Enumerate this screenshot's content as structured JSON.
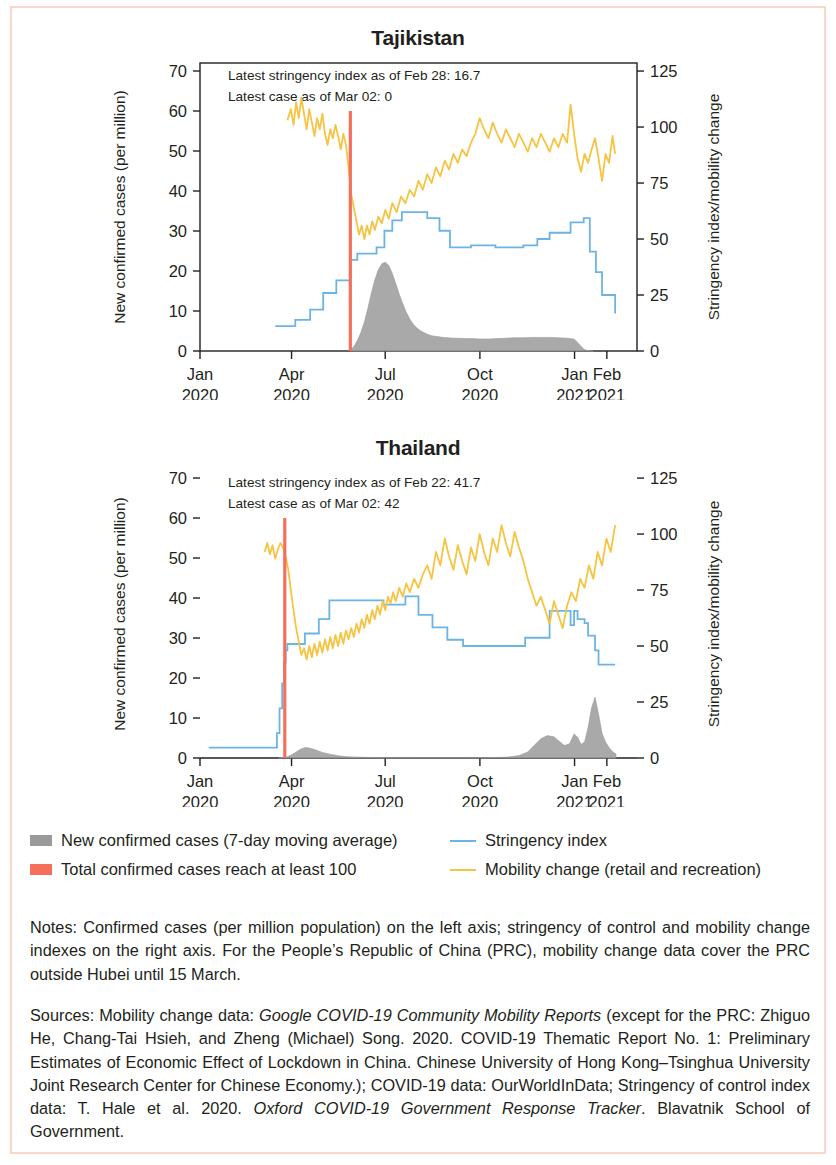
{
  "frame": {
    "border_color": "#f7d8cb"
  },
  "colors": {
    "cases_area": "#9a9a9a",
    "threshold_line": "#f4705a",
    "stringency_line": "#6cb4e4",
    "mobility_line": "#f5c443",
    "axis": "#231f20"
  },
  "legend": {
    "items": [
      {
        "label": "New confirmed cases (7-day moving average)",
        "marker": "area-swatch",
        "color": "#9a9a9a"
      },
      {
        "label": "Stringency index",
        "marker": "line-swatch",
        "color": "#6cb4e4"
      },
      {
        "label": "Total confirmed cases reach at least 100",
        "marker": "area-swatch",
        "color": "#f4705a"
      },
      {
        "label": "Mobility change (retail and recreation)",
        "marker": "line-swatch",
        "color": "#f5c443"
      }
    ]
  },
  "notes": {
    "label": "Notes:",
    "text": " Confirmed cases (per million population) on the left axis; stringency of control and mobility change indexes on the right axis. For the People’s Republic of China (PRC), mobility change data cover the PRC outside Hubei until 15 March."
  },
  "sources": {
    "label": "Sources:",
    "part1": " Mobility change data: ",
    "italic1": "Google COVID-19 Community Mobility Reports",
    "part2": " (except for the PRC: Zhiguo He, Chang-Tai Hsieh, and Zheng (Michael) Song. 2020. COVID-19 Thematic Report No. 1: Preliminary Estimates of Economic Effect of Lockdown in China. Chinese University of Hong Kong–Tsinghua University Joint Research Center for Chinese Economy.); COVID-19 data: OurWorldInData; Stringency of control index data: T. Hale et al. 2020. ",
    "italic2": "Oxford COVID-19 Government Response Tracker",
    "part3": ". Blavatnik School of Government."
  },
  "chart_data": [
    {
      "type": "line",
      "title": "Tajikistan",
      "xlabel": "",
      "ylabel": "New confirmed cases (per million)",
      "y2label": "Stringency index/mobility change",
      "ylim": [
        0,
        72
      ],
      "y2lim": [
        0,
        128.6
      ],
      "yticks": [
        0,
        10,
        20,
        30,
        40,
        50,
        60,
        70
      ],
      "y2ticks": [
        0,
        25,
        50,
        75,
        100,
        125
      ],
      "grid": false,
      "box_frame": true,
      "xtick_labels": [
        {
          "month": "Jan",
          "year": "2020",
          "pos": 0.0
        },
        {
          "month": "Apr",
          "year": "2020",
          "pos": 0.2095
        },
        {
          "month": "Jul",
          "year": "2020",
          "pos": 0.4238
        },
        {
          "month": "Oct",
          "year": "2020",
          "pos": 0.6405
        },
        {
          "month": "Jan",
          "year": "2021",
          "pos": 0.8571
        },
        {
          "month": "Feb",
          "year": "2021",
          "pos": 0.931
        }
      ],
      "annotations": [
        "Latest stringency index as of Feb 28: 16.7",
        "Latest case as of Mar 02: 0"
      ],
      "threshold_marker": {
        "label": "Total confirmed cases reach at least 100",
        "pos": 0.344
      },
      "series": [
        {
          "name": "New confirmed cases (7-day moving average)",
          "axis": "left",
          "kind": "area",
          "color": "#9a9a9a",
          "x": [
            0.344,
            0.352,
            0.36,
            0.368,
            0.376,
            0.384,
            0.392,
            0.4,
            0.408,
            0.416,
            0.424,
            0.432,
            0.44,
            0.448,
            0.456,
            0.464,
            0.472,
            0.48,
            0.488,
            0.496,
            0.504,
            0.512,
            0.52,
            0.528,
            0.536,
            0.544,
            0.556,
            0.568,
            0.58,
            0.592,
            0.608,
            0.624,
            0.64,
            0.66,
            0.68,
            0.7,
            0.72,
            0.74,
            0.76,
            0.78,
            0.8,
            0.82,
            0.84,
            0.855,
            0.862,
            0.87,
            0.878,
            0.886,
            0.9
          ],
          "y": [
            0.2,
            1.1,
            2.6,
            4.6,
            7.2,
            10.6,
            14.4,
            17.8,
            20.3,
            21.8,
            22.2,
            21.4,
            19.4,
            16.9,
            14.2,
            11.8,
            9.7,
            8.0,
            6.7,
            5.8,
            5.1,
            4.6,
            4.2,
            3.9,
            3.7,
            3.6,
            3.4,
            3.3,
            3.2,
            3.2,
            3.1,
            3.1,
            3.0,
            3.0,
            3.1,
            3.2,
            3.3,
            3.3,
            3.4,
            3.4,
            3.4,
            3.3,
            3.2,
            3.0,
            2.4,
            1.4,
            0.5,
            0.1,
            0.0
          ]
        },
        {
          "name": "Stringency index",
          "axis": "right",
          "kind": "step",
          "color": "#6cb4e4",
          "x": [
            0.172,
            0.205,
            0.218,
            0.238,
            0.252,
            0.268,
            0.282,
            0.296,
            0.312,
            0.33,
            0.344,
            0.36,
            0.382,
            0.404,
            0.422,
            0.44,
            0.462,
            0.492,
            0.52,
            0.548,
            0.572,
            0.596,
            0.62,
            0.648,
            0.676,
            0.704,
            0.74,
            0.772,
            0.8,
            0.828,
            0.848,
            0.864,
            0.878,
            0.892,
            0.906,
            0.92,
            0.934,
            0.95
          ],
          "y": [
            11.1,
            11.1,
            13.9,
            13.9,
            18.5,
            18.5,
            25.9,
            25.9,
            31.5,
            31.5,
            40.7,
            43.5,
            43.5,
            46.3,
            53.7,
            58.3,
            62.0,
            62.0,
            59.3,
            53.7,
            46.3,
            46.3,
            47.2,
            47.2,
            46.3,
            46.3,
            47.2,
            50.0,
            52.8,
            52.8,
            57.4,
            57.4,
            59.3,
            44.4,
            35.2,
            25.0,
            25.0,
            16.7
          ]
        },
        {
          "name": "Mobility change (retail and recreation)",
          "axis": "right",
          "kind": "line",
          "color": "#f5c443",
          "x": [
            0.2,
            0.208,
            0.214,
            0.22,
            0.226,
            0.232,
            0.238,
            0.244,
            0.25,
            0.256,
            0.262,
            0.268,
            0.274,
            0.28,
            0.286,
            0.292,
            0.298,
            0.304,
            0.31,
            0.316,
            0.322,
            0.328,
            0.334,
            0.34,
            0.346,
            0.352,
            0.358,
            0.364,
            0.37,
            0.376,
            0.382,
            0.388,
            0.394,
            0.4,
            0.408,
            0.416,
            0.424,
            0.432,
            0.44,
            0.45,
            0.46,
            0.47,
            0.48,
            0.49,
            0.5,
            0.51,
            0.52,
            0.53,
            0.54,
            0.55,
            0.56,
            0.57,
            0.58,
            0.59,
            0.6,
            0.61,
            0.62,
            0.63,
            0.64,
            0.65,
            0.66,
            0.67,
            0.68,
            0.69,
            0.7,
            0.71,
            0.72,
            0.73,
            0.74,
            0.75,
            0.76,
            0.77,
            0.78,
            0.79,
            0.8,
            0.81,
            0.82,
            0.83,
            0.84,
            0.848,
            0.856,
            0.864,
            0.872,
            0.88,
            0.888,
            0.896,
            0.904,
            0.912,
            0.92,
            0.928,
            0.936,
            0.944,
            0.95
          ],
          "y": [
            103,
            108,
            101,
            111,
            104,
            113,
            106,
            99,
            108,
            102,
            96,
            104,
            99,
            106,
            97,
            92,
            99,
            95,
            101,
            96,
            90,
            97,
            92,
            82,
            70,
            64,
            58,
            52,
            56,
            50,
            56,
            52,
            58,
            54,
            60,
            57,
            63,
            59,
            66,
            62,
            69,
            66,
            72,
            69,
            76,
            72,
            79,
            75,
            82,
            78,
            85,
            81,
            88,
            84,
            90,
            87,
            93,
            97,
            104,
            99,
            95,
            102,
            97,
            93,
            99,
            95,
            91,
            97,
            93,
            89,
            95,
            91,
            97,
            93,
            89,
            95,
            91,
            97,
            93,
            110,
            97,
            86,
            80,
            88,
            84,
            90,
            95,
            86,
            76,
            88,
            84,
            96,
            88
          ]
        }
      ]
    },
    {
      "type": "line",
      "title": "Thailand",
      "xlabel": "",
      "ylabel": "New confirmed cases (per million)",
      "y2label": "Stringency index/mobility change",
      "ylim": [
        0,
        72
      ],
      "y2lim": [
        0,
        128.6
      ],
      "yticks": [
        0,
        10,
        20,
        30,
        40,
        50,
        60,
        70
      ],
      "y2ticks": [
        0,
        25,
        50,
        75,
        100,
        125
      ],
      "grid": false,
      "box_frame": false,
      "xtick_labels": [
        {
          "month": "Jan",
          "year": "2020",
          "pos": 0.0
        },
        {
          "month": "Apr",
          "year": "2020",
          "pos": 0.2095
        },
        {
          "month": "Jul",
          "year": "2020",
          "pos": 0.4238
        },
        {
          "month": "Oct",
          "year": "2020",
          "pos": 0.6405
        },
        {
          "month": "Jan",
          "year": "2021",
          "pos": 0.8571
        },
        {
          "month": "Feb",
          "year": "2021",
          "pos": 0.931
        }
      ],
      "annotations": [
        "Latest stringency index as of Feb 22: 41.7",
        "Latest case as of Mar 02: 42"
      ],
      "threshold_marker": {
        "label": "Total confirmed cases reach at least 100",
        "pos": 0.194
      },
      "series": [
        {
          "name": "New confirmed cases (7-day moving average)",
          "axis": "left",
          "kind": "area",
          "color": "#9a9a9a",
          "x": [
            0.18,
            0.19,
            0.2,
            0.21,
            0.22,
            0.23,
            0.24,
            0.25,
            0.26,
            0.27,
            0.28,
            0.3,
            0.32,
            0.34,
            0.38,
            0.42,
            0.47,
            0.52,
            0.57,
            0.62,
            0.66,
            0.69,
            0.71,
            0.73,
            0.75,
            0.765,
            0.78,
            0.795,
            0.81,
            0.822,
            0.834,
            0.846,
            0.856,
            0.864,
            0.872,
            0.88,
            0.888,
            0.896,
            0.904,
            0.912,
            0.92,
            0.928,
            0.936,
            0.944,
            0.952
          ],
          "y": [
            0.0,
            0.1,
            0.3,
            0.8,
            1.5,
            2.2,
            2.6,
            2.5,
            2.2,
            1.8,
            1.4,
            0.9,
            0.5,
            0.3,
            0.15,
            0.1,
            0.08,
            0.07,
            0.07,
            0.08,
            0.1,
            0.15,
            0.3,
            0.6,
            1.5,
            3.2,
            4.8,
            5.6,
            5.3,
            4.2,
            3.1,
            3.6,
            6.0,
            5.2,
            3.4,
            4.0,
            7.6,
            12.5,
            15.2,
            11.0,
            6.2,
            4.0,
            2.6,
            1.6,
            1.0
          ]
        },
        {
          "name": "Stringency index",
          "axis": "right",
          "kind": "step",
          "color": "#6cb4e4",
          "x": [
            0.02,
            0.06,
            0.1,
            0.14,
            0.168,
            0.176,
            0.182,
            0.188,
            0.192,
            0.196,
            0.2,
            0.206,
            0.214,
            0.226,
            0.24,
            0.256,
            0.272,
            0.296,
            0.33,
            0.38,
            0.42,
            0.438,
            0.452,
            0.47,
            0.486,
            0.5,
            0.516,
            0.532,
            0.548,
            0.566,
            0.584,
            0.602,
            0.62,
            0.64,
            0.664,
            0.69,
            0.716,
            0.744,
            0.772,
            0.79,
            0.8,
            0.812,
            0.824,
            0.836,
            0.848,
            0.856,
            0.864,
            0.872,
            0.88,
            0.888,
            0.896,
            0.904,
            0.912,
            0.92,
            0.936,
            0.95
          ],
          "y": [
            4.6,
            4.6,
            4.6,
            4.6,
            4.6,
            11.1,
            22.2,
            33.3,
            42.6,
            48.1,
            50.9,
            50.9,
            50.9,
            50.9,
            55.6,
            55.6,
            62.0,
            70.4,
            70.4,
            70.4,
            68.5,
            68.5,
            68.5,
            72.2,
            72.2,
            63.9,
            63.9,
            58.3,
            58.3,
            52.8,
            52.8,
            50.0,
            50.0,
            50.0,
            50.0,
            50.0,
            50.0,
            53.7,
            53.7,
            53.7,
            65.7,
            65.7,
            65.7,
            65.7,
            59.3,
            65.7,
            62.0,
            62.0,
            60.2,
            54.6,
            54.6,
            48.1,
            41.7,
            41.7,
            41.7,
            41.7
          ]
        },
        {
          "name": "Mobility change (retail and recreation)",
          "axis": "right",
          "kind": "line",
          "color": "#f5c443",
          "x": [
            0.148,
            0.154,
            0.16,
            0.166,
            0.172,
            0.178,
            0.184,
            0.19,
            0.196,
            0.202,
            0.208,
            0.214,
            0.22,
            0.226,
            0.232,
            0.238,
            0.244,
            0.25,
            0.256,
            0.262,
            0.268,
            0.274,
            0.28,
            0.286,
            0.292,
            0.298,
            0.304,
            0.31,
            0.316,
            0.322,
            0.328,
            0.334,
            0.34,
            0.346,
            0.352,
            0.358,
            0.364,
            0.37,
            0.376,
            0.382,
            0.388,
            0.394,
            0.4,
            0.406,
            0.412,
            0.418,
            0.424,
            0.43,
            0.436,
            0.442,
            0.448,
            0.456,
            0.464,
            0.472,
            0.48,
            0.49,
            0.5,
            0.51,
            0.52,
            0.53,
            0.54,
            0.55,
            0.56,
            0.57,
            0.58,
            0.59,
            0.6,
            0.61,
            0.62,
            0.63,
            0.64,
            0.65,
            0.66,
            0.67,
            0.68,
            0.69,
            0.7,
            0.71,
            0.72,
            0.73,
            0.74,
            0.75,
            0.76,
            0.77,
            0.78,
            0.79,
            0.8,
            0.81,
            0.82,
            0.83,
            0.84,
            0.85,
            0.86,
            0.87,
            0.88,
            0.89,
            0.9,
            0.91,
            0.92,
            0.93,
            0.94,
            0.95
          ],
          "y": [
            92,
            96,
            91,
            95,
            89,
            93,
            96,
            94,
            90,
            84,
            75,
            66,
            58,
            52,
            46,
            49,
            44,
            50,
            45,
            51,
            46,
            52,
            47,
            53,
            48,
            54,
            49,
            55,
            50,
            56,
            51,
            57,
            53,
            58,
            54,
            60,
            56,
            62,
            58,
            64,
            60,
            66,
            62,
            68,
            64,
            70,
            66,
            72,
            69,
            74,
            70,
            76,
            72,
            78,
            74,
            80,
            76,
            82,
            86,
            80,
            92,
            86,
            98,
            90,
            84,
            95,
            88,
            82,
            94,
            88,
            100,
            92,
            86,
            98,
            92,
            104,
            96,
            90,
            101,
            94,
            88,
            80,
            74,
            68,
            72,
            66,
            60,
            70,
            64,
            58,
            68,
            74,
            70,
            80,
            76,
            86,
            80,
            92,
            86,
            98,
            92,
            104
          ]
        }
      ]
    }
  ]
}
